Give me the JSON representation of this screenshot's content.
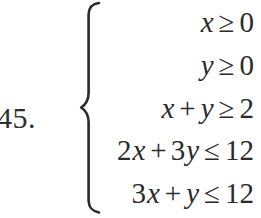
{
  "problem": {
    "number_label": "45.",
    "brace": "left-curly-brace"
  },
  "system": {
    "rows": [
      {
        "id": "row-1",
        "text": "x ≥ 0",
        "lhs_coefficient": "",
        "lhs_variable": "x",
        "operator": "",
        "second_coefficient": "",
        "second_variable": "",
        "relation": "≥",
        "rhs": "0"
      },
      {
        "id": "row-2",
        "text": "y ≥ 0",
        "lhs_coefficient": "",
        "lhs_variable": "y",
        "operator": "",
        "second_coefficient": "",
        "second_variable": "",
        "relation": "≥",
        "rhs": "0"
      },
      {
        "id": "row-3",
        "text": "x + y ≥ 2",
        "lhs_coefficient": "",
        "lhs_variable": "x",
        "operator": "+",
        "second_coefficient": "",
        "second_variable": "y",
        "relation": "≥",
        "rhs": "2"
      },
      {
        "id": "row-4",
        "text": "2x + 3y ≤ 12",
        "lhs_coefficient": "2",
        "lhs_variable": "x",
        "operator": "+",
        "second_coefficient": "3",
        "second_variable": "y",
        "relation": "≤",
        "rhs": "12"
      },
      {
        "id": "row-5",
        "text": "3x + y ≤ 12",
        "lhs_coefficient": "3",
        "lhs_variable": "x",
        "operator": "+",
        "second_coefficient": "",
        "second_variable": "y",
        "relation": "≤",
        "rhs": "12"
      }
    ]
  },
  "colors": {
    "background": "#ffffff",
    "ink": "#2a2a2a"
  }
}
